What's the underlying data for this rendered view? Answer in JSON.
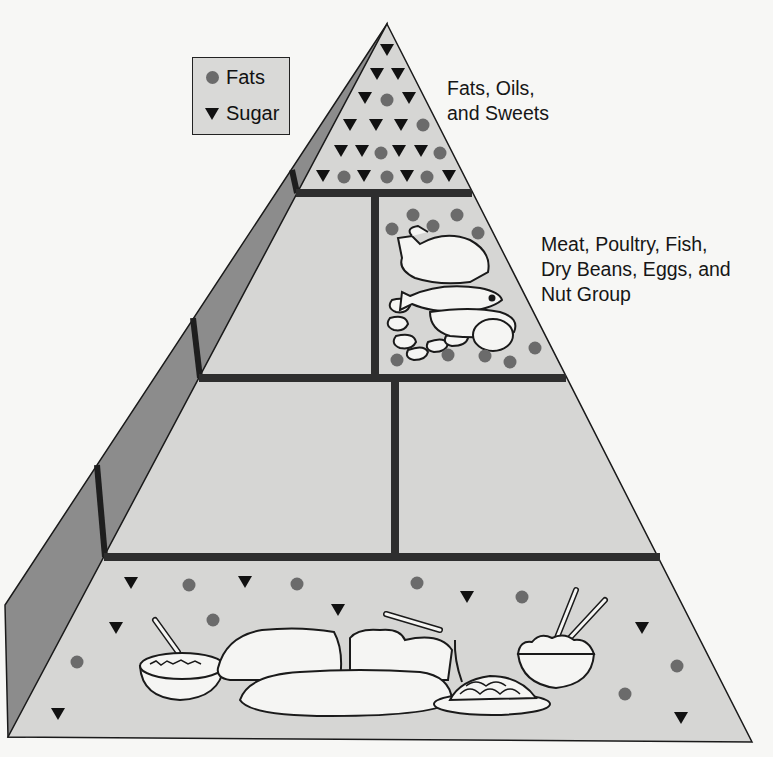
{
  "legend": {
    "items": [
      {
        "symbol": "circle",
        "label": "Fats"
      },
      {
        "symbol": "triangle",
        "label": "Sugar"
      }
    ]
  },
  "tiers": [
    {
      "name": "fats-oils-sweets",
      "label": "Fats, Oils,\nand Sweets"
    },
    {
      "name": "meat-group",
      "label": "Meat, Poultry, Fish,\nDry Beans, Eggs, and\nNut Group"
    },
    {
      "name": "milk-vegetable-fruit",
      "label": ""
    },
    {
      "name": "bread-cereal-rice-pasta",
      "label": ""
    }
  ],
  "colors": {
    "background": "#f7f7f5",
    "front_face": "#d6d6d4",
    "side_face": "#8c8c8c",
    "divider": "#2e2e2e",
    "fat_dot": "#6b6b6b",
    "sugar_triangle": "#111111",
    "outline": "#1a1a1a",
    "food_fill": "#f5f5f3"
  },
  "symbols": {
    "top_tier": [
      {
        "t": "tri",
        "x": 387,
        "y": 50
      },
      {
        "t": "tri",
        "x": 377,
        "y": 74
      },
      {
        "t": "tri",
        "x": 398,
        "y": 74
      },
      {
        "t": "tri",
        "x": 365,
        "y": 98
      },
      {
        "t": "dot",
        "x": 387,
        "y": 100
      },
      {
        "t": "tri",
        "x": 409,
        "y": 98
      },
      {
        "t": "tri",
        "x": 350,
        "y": 125
      },
      {
        "t": "tri",
        "x": 376,
        "y": 125
      },
      {
        "t": "tri",
        "x": 401,
        "y": 125
      },
      {
        "t": "dot",
        "x": 423,
        "y": 125
      },
      {
        "t": "tri",
        "x": 341,
        "y": 151
      },
      {
        "t": "tri",
        "x": 362,
        "y": 151
      },
      {
        "t": "dot",
        "x": 381,
        "y": 153
      },
      {
        "t": "tri",
        "x": 399,
        "y": 151
      },
      {
        "t": "tri",
        "x": 421,
        "y": 151
      },
      {
        "t": "dot",
        "x": 440,
        "y": 153
      },
      {
        "t": "tri",
        "x": 323,
        "y": 176
      },
      {
        "t": "dot",
        "x": 344,
        "y": 177
      },
      {
        "t": "tri",
        "x": 364,
        "y": 176
      },
      {
        "t": "dot",
        "x": 387,
        "y": 177
      },
      {
        "t": "tri",
        "x": 407,
        "y": 176
      },
      {
        "t": "dot",
        "x": 427,
        "y": 177
      },
      {
        "t": "tri",
        "x": 449,
        "y": 176
      }
    ],
    "meat_tier": [
      {
        "t": "dot",
        "x": 392,
        "y": 229
      },
      {
        "t": "dot",
        "x": 413,
        "y": 215
      },
      {
        "t": "dot",
        "x": 433,
        "y": 226
      },
      {
        "t": "dot",
        "x": 457,
        "y": 215
      },
      {
        "t": "dot",
        "x": 478,
        "y": 233
      },
      {
        "t": "dot",
        "x": 397,
        "y": 360
      },
      {
        "t": "dot",
        "x": 448,
        "y": 355
      },
      {
        "t": "dot",
        "x": 485,
        "y": 356
      },
      {
        "t": "dot",
        "x": 510,
        "y": 362
      },
      {
        "t": "dot",
        "x": 535,
        "y": 348
      }
    ],
    "base_tier": [
      {
        "t": "tri",
        "x": 131,
        "y": 583
      },
      {
        "t": "dot",
        "x": 189,
        "y": 585
      },
      {
        "t": "tri",
        "x": 245,
        "y": 582
      },
      {
        "t": "dot",
        "x": 297,
        "y": 584
      },
      {
        "t": "dot",
        "x": 417,
        "y": 583
      },
      {
        "t": "tri",
        "x": 467,
        "y": 597
      },
      {
        "t": "dot",
        "x": 522,
        "y": 597
      },
      {
        "t": "tri",
        "x": 116,
        "y": 628
      },
      {
        "t": "dot",
        "x": 213,
        "y": 620
      },
      {
        "t": "tri",
        "x": 338,
        "y": 610
      },
      {
        "t": "tri",
        "x": 642,
        "y": 628
      },
      {
        "t": "dot",
        "x": 77,
        "y": 662
      },
      {
        "t": "dot",
        "x": 677,
        "y": 666
      },
      {
        "t": "dot",
        "x": 625,
        "y": 694
      },
      {
        "t": "tri",
        "x": 58,
        "y": 714
      },
      {
        "t": "tri",
        "x": 681,
        "y": 718
      }
    ]
  },
  "food_icons": {
    "meat_tier": [
      "poultry-drumstick",
      "fish",
      "nuts-beans",
      "egg"
    ],
    "base_tier": [
      "cereal-bowl",
      "bread-loaf",
      "sliced-bread",
      "baguette",
      "spaghetti-plate",
      "rice-bowl-chopsticks"
    ]
  }
}
